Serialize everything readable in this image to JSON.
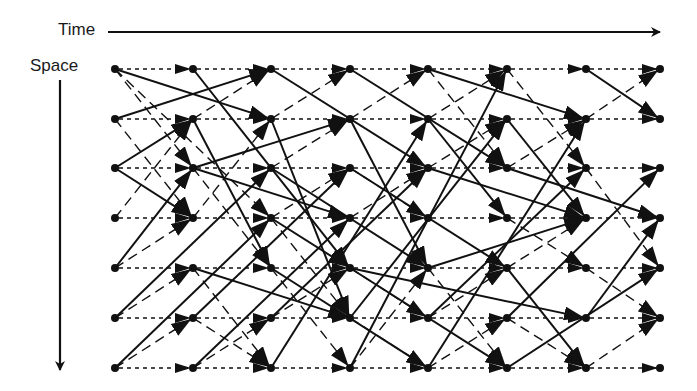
{
  "labels": {
    "time": "Time",
    "space": "Space"
  },
  "colors": {
    "ink": "#111111",
    "background": "#ffffff"
  },
  "grid": {
    "columns_x": [
      115,
      193,
      271,
      350,
      428,
      507,
      586,
      660
    ],
    "rows_y": [
      69,
      119,
      168,
      218,
      268,
      318,
      368
    ]
  },
  "edges": {
    "solid": [
      [
        0,
        0,
        2,
        1
      ],
      [
        0,
        1,
        2,
        0
      ],
      [
        1,
        0,
        3,
        4
      ],
      [
        0,
        2,
        1,
        1
      ],
      [
        1,
        2,
        3,
        1
      ],
      [
        1,
        2,
        3,
        3
      ],
      [
        0,
        2,
        1,
        3
      ],
      [
        2,
        0,
        4,
        2
      ],
      [
        1,
        1,
        2,
        4
      ],
      [
        2,
        1,
        3,
        5
      ],
      [
        3,
        0,
        5,
        2
      ],
      [
        3,
        1,
        4,
        4
      ],
      [
        4,
        0,
        6,
        1
      ],
      [
        4,
        1,
        5,
        3
      ],
      [
        3,
        2,
        5,
        4
      ],
      [
        4,
        2,
        6,
        3
      ],
      [
        5,
        1,
        6,
        3
      ],
      [
        5,
        2,
        7,
        3
      ],
      [
        6,
        0,
        7,
        1
      ],
      [
        2,
        2,
        4,
        4
      ],
      [
        0,
        4,
        1,
        2
      ],
      [
        0,
        5,
        2,
        2
      ],
      [
        0,
        6,
        2,
        3
      ],
      [
        1,
        4,
        3,
        5
      ],
      [
        1,
        5,
        3,
        2
      ],
      [
        1,
        6,
        3,
        3
      ],
      [
        2,
        5,
        4,
        2
      ],
      [
        2,
        6,
        4,
        1
      ],
      [
        2,
        4,
        4,
        6
      ],
      [
        3,
        4,
        5,
        6
      ],
      [
        3,
        5,
        5,
        1
      ],
      [
        3,
        6,
        5,
        0
      ],
      [
        4,
        6,
        6,
        1
      ],
      [
        4,
        4,
        6,
        3
      ],
      [
        4,
        5,
        6,
        2
      ],
      [
        5,
        5,
        7,
        2
      ],
      [
        5,
        4,
        6,
        6
      ],
      [
        6,
        5,
        7,
        3
      ],
      [
        5,
        6,
        7,
        4
      ],
      [
        3,
        4,
        6,
        5
      ],
      [
        2,
        3,
        3,
        4
      ]
    ],
    "dashed": [
      [
        0,
        0,
        1,
        2
      ],
      [
        0,
        0,
        2,
        3
      ],
      [
        0,
        1,
        1,
        3
      ],
      [
        0,
        3,
        1,
        1
      ],
      [
        1,
        1,
        2,
        0
      ],
      [
        1,
        3,
        2,
        1
      ],
      [
        1,
        2,
        2,
        4
      ],
      [
        2,
        1,
        3,
        0
      ],
      [
        2,
        2,
        3,
        1
      ],
      [
        2,
        3,
        3,
        5
      ],
      [
        3,
        1,
        4,
        0
      ],
      [
        3,
        3,
        4,
        2
      ],
      [
        3,
        2,
        4,
        3
      ],
      [
        4,
        1,
        5,
        0
      ],
      [
        4,
        0,
        5,
        2
      ],
      [
        4,
        2,
        5,
        1
      ],
      [
        5,
        0,
        6,
        2
      ],
      [
        5,
        2,
        6,
        1
      ],
      [
        6,
        1,
        7,
        0
      ],
      [
        6,
        2,
        7,
        4
      ],
      [
        5,
        3,
        6,
        4
      ],
      [
        0,
        4,
        1,
        3
      ],
      [
        0,
        5,
        1,
        4
      ],
      [
        0,
        6,
        1,
        5
      ],
      [
        1,
        5,
        2,
        6
      ],
      [
        1,
        4,
        2,
        6
      ],
      [
        2,
        4,
        3,
        6
      ],
      [
        2,
        5,
        3,
        4
      ],
      [
        3,
        5,
        4,
        6
      ],
      [
        3,
        4,
        4,
        5
      ],
      [
        4,
        5,
        5,
        4
      ],
      [
        4,
        6,
        5,
        5
      ],
      [
        5,
        5,
        6,
        6
      ],
      [
        6,
        6,
        7,
        5
      ],
      [
        5,
        4,
        6,
        3
      ],
      [
        6,
        4,
        7,
        5
      ],
      [
        1,
        6,
        2,
        5
      ],
      [
        3,
        6,
        4,
        4
      ],
      [
        4,
        4,
        5,
        6
      ],
      [
        2,
        3,
        3,
        2
      ]
    ]
  }
}
